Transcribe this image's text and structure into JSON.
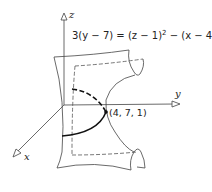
{
  "figure": {
    "equation": {
      "lhs": "3(y − 7) = (z − 1)",
      "mid": " − (x − 4)",
      "exp1": "2",
      "exp2": "2"
    },
    "point_label": "(4, 7, 1)",
    "axes": {
      "x": "x",
      "y": "y",
      "z": "z"
    },
    "surface": "hyperbolic paraboloid (saddle)",
    "colors": {
      "line": "#333333",
      "curve": "#111111",
      "background": "#ffffff"
    }
  }
}
